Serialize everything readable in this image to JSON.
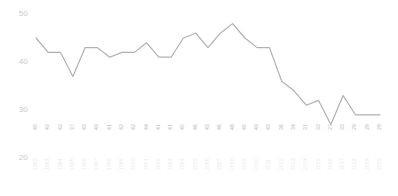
{
  "chart_data": {
    "type": "line",
    "title": "",
    "xlabel": "",
    "ylabel": "",
    "grid": false,
    "legend": false,
    "ylim": [
      20,
      50
    ],
    "y_ticks": [
      50,
      40,
      30,
      20
    ],
    "line_color": "#b0b0b0",
    "categories": [
      "1992",
      "1993",
      "1994",
      "1995",
      "1996",
      "1997",
      "1998",
      "1999",
      "2000",
      "2001",
      "2002",
      "2003",
      "2004",
      "2005",
      "2006",
      "2007",
      "2008",
      "2009",
      "2010",
      "2011",
      "2012",
      "2013",
      "2014",
      "2015",
      "2016",
      "2017",
      "2018",
      "2019",
      "2020"
    ],
    "values": [
      45,
      42,
      42,
      37,
      43,
      43,
      41,
      42,
      42,
      44,
      41,
      41,
      45,
      46,
      43,
      46,
      48,
      45,
      43,
      43,
      36,
      34,
      31,
      32,
      27,
      33,
      29,
      29,
      29
    ],
    "point_labels": [
      "45",
      "42",
      "42",
      "37",
      "43",
      "43",
      "41",
      "42",
      "42",
      "44",
      "41",
      "41",
      "45",
      "46",
      "43",
      "46",
      "48",
      "45",
      "43",
      "43",
      "36",
      "34",
      "31",
      "32",
      "27",
      "33",
      "29",
      "29",
      "29"
    ]
  }
}
